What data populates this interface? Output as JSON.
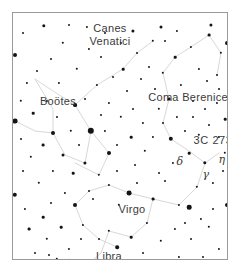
{
  "chart": {
    "type": "sky-map",
    "background_color": "#ffffff",
    "star_color": "#141414",
    "line_color": "#d8d8d8",
    "label_color": "#3a3a3a",
    "frame": {
      "border_color": "#9a9a9a",
      "x": 12,
      "y": 12,
      "width": 216,
      "height": 248
    }
  },
  "labels": {
    "canes_venatici": {
      "text": "Canes\nVenatici",
      "line1": "Canes",
      "line2": "Venatici",
      "x": 97,
      "y": 22
    },
    "bootes": {
      "text": "Boötes",
      "x": 45,
      "y": 88
    },
    "coma_berenices": {
      "text": "Coma Berenices",
      "x": 178,
      "y": 84
    },
    "quasar_3c273": {
      "text": "3C 273",
      "x": 200,
      "y": 127
    },
    "delta": {
      "text": "δ",
      "x": 167,
      "y": 148
    },
    "eta": {
      "text": "η",
      "x": 209,
      "y": 146
    },
    "gamma": {
      "text": "γ",
      "x": 193,
      "y": 161
    },
    "virgo": {
      "text": "Virgo",
      "x": 119,
      "y": 196
    },
    "libra": {
      "text": "Libra",
      "x": 96,
      "y": 243
    }
  },
  "constellation_lines": [
    {
      "name": "bootes-figure",
      "points": "22,66 40,78 62,92 78,118 72,150 52,142 40,120 40,96 22,66"
    },
    {
      "name": "bootes-upper-arm",
      "points": "62,92 84,72 110,56"
    },
    {
      "name": "bootes-lower-kite",
      "points": "78,118 96,140 86,162 62,150"
    },
    {
      "name": "canes-venatici-line",
      "points": "110,56 124,40 140,28"
    },
    {
      "name": "coma-berenices-line",
      "points": "150,60 162,44 178,34 196,22"
    },
    {
      "name": "coma-to-virgo",
      "points": "150,60 156,86 150,110 158,126"
    },
    {
      "name": "virgo-upper",
      "points": "158,126 176,138 192,150 206,140"
    },
    {
      "name": "virgo-spica-chain",
      "points": "192,150 184,174 166,192 140,186 116,180"
    },
    {
      "name": "virgo-west-wing",
      "points": "116,180 96,172 76,178 62,192 70,212"
    },
    {
      "name": "virgo-lower",
      "points": "140,186 134,210 118,224 96,218"
    },
    {
      "name": "virgo-tail",
      "points": "70,212 86,226 104,234"
    },
    {
      "name": "libra-line",
      "points": "96,218 88,240 74,252 56,246"
    },
    {
      "name": "left-edge-line",
      "points": "2,108 22,118 40,120"
    },
    {
      "name": "upper-right-line",
      "points": "196,22 208,40 204,62"
    }
  ],
  "stars": [
    {
      "x": 78,
      "y": 118,
      "r": 3.2
    },
    {
      "x": 40,
      "y": 120,
      "r": 2.0
    },
    {
      "x": 62,
      "y": 92,
      "r": 1.9
    },
    {
      "x": 96,
      "y": 140,
      "r": 2.0
    },
    {
      "x": 158,
      "y": 126,
      "r": 2.2
    },
    {
      "x": 116,
      "y": 180,
      "r": 2.4
    },
    {
      "x": 192,
      "y": 150,
      "r": 1.7
    },
    {
      "x": 176,
      "y": 194,
      "r": 2.3
    },
    {
      "x": 62,
      "y": 192,
      "r": 2.0
    },
    {
      "x": 104,
      "y": 234,
      "r": 1.8
    },
    {
      "x": 2,
      "y": 108,
      "r": 2.4
    },
    {
      "x": 2,
      "y": 182,
      "r": 2.2
    },
    {
      "x": 2,
      "y": 42,
      "r": 2.0
    },
    {
      "x": 214,
      "y": 192,
      "r": 2.0
    },
    {
      "x": 214,
      "y": 30,
      "r": 1.9
    },
    {
      "x": 198,
      "y": 12,
      "r": 1.6
    },
    {
      "x": 148,
      "y": 14,
      "r": 1.5
    },
    {
      "x": 120,
      "y": 18,
      "r": 1.6
    },
    {
      "x": 31,
      "y": 13,
      "r": 1.7
    },
    {
      "x": 50,
      "y": 30,
      "r": 1.2
    },
    {
      "x": 76,
      "y": 36,
      "r": 1.1
    },
    {
      "x": 88,
      "y": 44,
      "r": 1.0
    },
    {
      "x": 64,
      "y": 56,
      "r": 1.2
    },
    {
      "x": 24,
      "y": 58,
      "r": 1.0
    },
    {
      "x": 14,
      "y": 70,
      "r": 1.1
    },
    {
      "x": 8,
      "y": 88,
      "r": 1.2
    },
    {
      "x": 20,
      "y": 100,
      "r": 1.3
    },
    {
      "x": 34,
      "y": 88,
      "r": 1.1
    },
    {
      "x": 44,
      "y": 104,
      "r": 1.0
    },
    {
      "x": 30,
      "y": 132,
      "r": 1.4
    },
    {
      "x": 18,
      "y": 144,
      "r": 1.2
    },
    {
      "x": 8,
      "y": 126,
      "r": 1.0
    },
    {
      "x": 50,
      "y": 142,
      "r": 1.5
    },
    {
      "x": 40,
      "y": 158,
      "r": 1.1
    },
    {
      "x": 26,
      "y": 170,
      "r": 1.2
    },
    {
      "x": 12,
      "y": 196,
      "r": 1.1
    },
    {
      "x": 30,
      "y": 204,
      "r": 1.3
    },
    {
      "x": 16,
      "y": 216,
      "r": 1.4
    },
    {
      "x": 34,
      "y": 226,
      "r": 1.2
    },
    {
      "x": 22,
      "y": 240,
      "r": 1.0
    },
    {
      "x": 48,
      "y": 214,
      "r": 1.3
    },
    {
      "x": 56,
      "y": 236,
      "r": 1.1
    },
    {
      "x": 68,
      "y": 226,
      "r": 1.0
    },
    {
      "x": 44,
      "y": 246,
      "r": 1.2
    },
    {
      "x": 60,
      "y": 160,
      "r": 1.3
    },
    {
      "x": 72,
      "y": 150,
      "r": 1.6
    },
    {
      "x": 86,
      "y": 162,
      "r": 1.2
    },
    {
      "x": 84,
      "y": 72,
      "r": 1.1
    },
    {
      "x": 100,
      "y": 64,
      "r": 1.0
    },
    {
      "x": 110,
      "y": 56,
      "r": 1.3
    },
    {
      "x": 96,
      "y": 90,
      "r": 1.1
    },
    {
      "x": 108,
      "y": 104,
      "r": 1.2
    },
    {
      "x": 120,
      "y": 96,
      "r": 1.0
    },
    {
      "x": 130,
      "y": 110,
      "r": 1.1
    },
    {
      "x": 118,
      "y": 124,
      "r": 1.3
    },
    {
      "x": 104,
      "y": 132,
      "r": 1.0
    },
    {
      "x": 92,
      "y": 118,
      "r": 1.1
    },
    {
      "x": 132,
      "y": 138,
      "r": 1.2
    },
    {
      "x": 122,
      "y": 152,
      "r": 1.0
    },
    {
      "x": 140,
      "y": 124,
      "r": 1.1
    },
    {
      "x": 146,
      "y": 96,
      "r": 1.2
    },
    {
      "x": 156,
      "y": 86,
      "r": 1.4
    },
    {
      "x": 150,
      "y": 110,
      "r": 1.0
    },
    {
      "x": 164,
      "y": 104,
      "r": 1.1
    },
    {
      "x": 172,
      "y": 118,
      "r": 1.0
    },
    {
      "x": 186,
      "y": 122,
      "r": 1.2
    },
    {
      "x": 196,
      "y": 112,
      "r": 1.0
    },
    {
      "x": 206,
      "y": 124,
      "r": 1.1
    },
    {
      "x": 212,
      "y": 106,
      "r": 1.3
    },
    {
      "x": 204,
      "y": 90,
      "r": 1.1
    },
    {
      "x": 192,
      "y": 96,
      "r": 1.0
    },
    {
      "x": 180,
      "y": 104,
      "r": 1.0
    },
    {
      "x": 168,
      "y": 72,
      "r": 1.1
    },
    {
      "x": 150,
      "y": 60,
      "r": 1.2
    },
    {
      "x": 162,
      "y": 44,
      "r": 1.3
    },
    {
      "x": 178,
      "y": 34,
      "r": 1.1
    },
    {
      "x": 196,
      "y": 22,
      "r": 1.4
    },
    {
      "x": 208,
      "y": 40,
      "r": 1.2
    },
    {
      "x": 204,
      "y": 62,
      "r": 1.0
    },
    {
      "x": 186,
      "y": 56,
      "r": 1.1
    },
    {
      "x": 140,
      "y": 28,
      "r": 1.2
    },
    {
      "x": 124,
      "y": 40,
      "r": 1.0
    },
    {
      "x": 108,
      "y": 30,
      "r": 1.1
    },
    {
      "x": 136,
      "y": 54,
      "r": 1.0
    },
    {
      "x": 152,
      "y": 28,
      "r": 1.0
    },
    {
      "x": 164,
      "y": 18,
      "r": 1.1
    },
    {
      "x": 176,
      "y": 140,
      "r": 1.3
    },
    {
      "x": 184,
      "y": 174,
      "r": 1.2
    },
    {
      "x": 166,
      "y": 192,
      "r": 1.1
    },
    {
      "x": 140,
      "y": 186,
      "r": 1.4
    },
    {
      "x": 152,
      "y": 168,
      "r": 1.0
    },
    {
      "x": 160,
      "y": 150,
      "r": 1.1
    },
    {
      "x": 146,
      "y": 160,
      "r": 1.0
    },
    {
      "x": 96,
      "y": 172,
      "r": 1.1
    },
    {
      "x": 80,
      "y": 186,
      "r": 1.0
    },
    {
      "x": 106,
      "y": 192,
      "r": 1.2
    },
    {
      "x": 134,
      "y": 210,
      "r": 1.1
    },
    {
      "x": 118,
      "y": 224,
      "r": 1.3
    },
    {
      "x": 96,
      "y": 218,
      "r": 1.2
    },
    {
      "x": 86,
      "y": 226,
      "r": 1.0
    },
    {
      "x": 70,
      "y": 212,
      "r": 1.1
    },
    {
      "x": 148,
      "y": 228,
      "r": 1.2
    },
    {
      "x": 162,
      "y": 216,
      "r": 1.1
    },
    {
      "x": 178,
      "y": 226,
      "r": 1.0
    },
    {
      "x": 196,
      "y": 214,
      "r": 1.2
    },
    {
      "x": 206,
      "y": 236,
      "r": 1.1
    },
    {
      "x": 190,
      "y": 244,
      "r": 1.0
    },
    {
      "x": 166,
      "y": 244,
      "r": 1.1
    },
    {
      "x": 130,
      "y": 240,
      "r": 1.0
    },
    {
      "x": 112,
      "y": 250,
      "r": 1.1
    },
    {
      "x": 84,
      "y": 252,
      "r": 1.0
    },
    {
      "x": 200,
      "y": 170,
      "r": 1.1
    },
    {
      "x": 210,
      "y": 158,
      "r": 1.0
    },
    {
      "x": 212,
      "y": 140,
      "r": 1.2
    },
    {
      "x": 200,
      "y": 196,
      "r": 1.0
    },
    {
      "x": 188,
      "y": 206,
      "r": 1.1
    },
    {
      "x": 58,
      "y": 118,
      "r": 1.2
    },
    {
      "x": 66,
      "y": 132,
      "r": 1.0
    },
    {
      "x": 88,
      "y": 102,
      "r": 1.0
    },
    {
      "x": 72,
      "y": 86,
      "r": 1.0
    },
    {
      "x": 46,
      "y": 70,
      "r": 1.1
    },
    {
      "x": 38,
      "y": 46,
      "r": 1.0
    },
    {
      "x": 92,
      "y": 20,
      "r": 1.0
    },
    {
      "x": 74,
      "y": 14,
      "r": 1.1
    },
    {
      "x": 56,
      "y": 12,
      "r": 1.0
    },
    {
      "x": 128,
      "y": 66,
      "r": 1.0
    },
    {
      "x": 114,
      "y": 78,
      "r": 1.0
    },
    {
      "x": 142,
      "y": 76,
      "r": 1.0
    },
    {
      "x": 104,
      "y": 158,
      "r": 1.0
    },
    {
      "x": 76,
      "y": 178,
      "r": 1.0
    },
    {
      "x": 52,
      "y": 180,
      "r": 1.1
    },
    {
      "x": 38,
      "y": 190,
      "r": 1.0
    },
    {
      "x": 10,
      "y": 158,
      "r": 1.0
    },
    {
      "x": 206,
      "y": 76,
      "r": 1.0
    },
    {
      "x": 194,
      "y": 68,
      "r": 1.0
    },
    {
      "x": 180,
      "y": 88,
      "r": 1.0
    },
    {
      "x": 172,
      "y": 210,
      "r": 1.0
    },
    {
      "x": 124,
      "y": 170,
      "r": 1.0
    },
    {
      "x": 212,
      "y": 250,
      "r": 1.1
    },
    {
      "x": 10,
      "y": 20,
      "r": 1.0
    },
    {
      "x": 36,
      "y": 242,
      "r": 1.0
    }
  ]
}
